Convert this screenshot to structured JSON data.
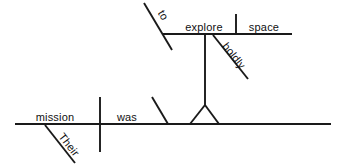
{
  "diagram": {
    "type": "sentence-diagram",
    "sentence": "Their mission was to explore space boldly",
    "background_color": "#ffffff",
    "line_color": "#1a1a1a",
    "text_color": "#111111",
    "words": [
      {
        "id": "subject",
        "label": "mission",
        "role": "subject",
        "x": 55,
        "y": 121,
        "rotation": 0,
        "anchor": "middle"
      },
      {
        "id": "modifier-their",
        "label": "Their",
        "role": "possessive-modifier",
        "x": 66,
        "y": 147,
        "rotation": 52,
        "anchor": "middle"
      },
      {
        "id": "verb",
        "label": "was",
        "role": "linking-verb",
        "x": 127,
        "y": 121,
        "rotation": 0,
        "anchor": "middle"
      },
      {
        "id": "infinitive-to",
        "label": "to",
        "role": "infinitive-marker",
        "x": 160,
        "y": 17,
        "rotation": 59,
        "anchor": "middle"
      },
      {
        "id": "infinitive-verb",
        "label": "explore",
        "role": "infinitive-verb",
        "x": 204,
        "y": 31,
        "rotation": 0,
        "anchor": "middle"
      },
      {
        "id": "object",
        "label": "space",
        "role": "direct-object",
        "x": 264,
        "y": 31,
        "rotation": 0,
        "anchor": "middle"
      },
      {
        "id": "adverb-boldly",
        "label": "boldly",
        "role": "adverb-modifier",
        "x": 231,
        "y": 58,
        "rotation": 52,
        "anchor": "middle"
      }
    ],
    "lines": [
      {
        "id": "main-baseline",
        "role": "main-baseline",
        "x1": 15,
        "y1": 124,
        "x2": 331,
        "y2": 124
      },
      {
        "id": "subject-verb-divider",
        "role": "subject-predicate-divider",
        "x1": 100,
        "y1": 97,
        "x2": 100,
        "y2": 152
      },
      {
        "id": "their-slant",
        "role": "modifier-slant-line",
        "x1": 45,
        "y1": 125,
        "x2": 75,
        "y2": 163
      },
      {
        "id": "complement-slant",
        "role": "predicate-complement-slant",
        "x1": 152,
        "y1": 97,
        "x2": 168,
        "y2": 124
      },
      {
        "id": "stand-left-leg",
        "role": "infinitive-stand-leg",
        "x1": 190,
        "y1": 124,
        "x2": 205,
        "y2": 105
      },
      {
        "id": "stand-right-leg",
        "role": "infinitive-stand-leg",
        "x1": 205,
        "y1": 105,
        "x2": 219,
        "y2": 124
      },
      {
        "id": "stand-riser",
        "role": "infinitive-stand-riser",
        "x1": 205,
        "y1": 105,
        "x2": 205,
        "y2": 35
      },
      {
        "id": "infinitive-baseline",
        "role": "infinitive-baseline",
        "x1": 163,
        "y1": 34,
        "x2": 292,
        "y2": 34
      },
      {
        "id": "to-slant",
        "role": "infinitive-marker-slant",
        "x1": 144,
        "y1": 3,
        "x2": 172,
        "y2": 50
      },
      {
        "id": "object-divider",
        "role": "direct-object-divider",
        "x1": 236,
        "y1": 14,
        "x2": 236,
        "y2": 34
      },
      {
        "id": "boldly-slant",
        "role": "adverb-slant-line",
        "x1": 213,
        "y1": 35,
        "x2": 248,
        "y2": 79
      }
    ]
  }
}
